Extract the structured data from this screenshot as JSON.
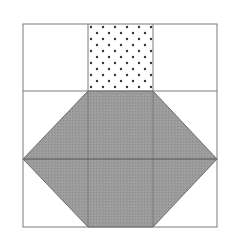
{
  "diagram": {
    "title": "",
    "grid": {
      "rows": 3,
      "cols": 3,
      "x": [
        23,
        88,
        153,
        217
      ],
      "y": [
        24,
        91,
        159,
        227
      ],
      "line_color": "#7a7a7a"
    },
    "regions": [
      {
        "name": "dotted-square",
        "fill": "dots",
        "dot_color": "#333333",
        "bg": "#ffffff",
        "cell": [
          0,
          1
        ]
      },
      {
        "name": "gray-hexagon",
        "fill": "#9b9b9b",
        "points": [
          [
            88,
            91
          ],
          [
            153,
            91
          ],
          [
            217,
            159
          ],
          [
            153,
            227
          ],
          [
            88,
            227
          ],
          [
            23,
            159
          ]
        ]
      }
    ],
    "colors": {
      "background": "#ffffff",
      "gray": "#9b9b9b",
      "line": "#6e6e6e",
      "dot": "#333333"
    }
  }
}
